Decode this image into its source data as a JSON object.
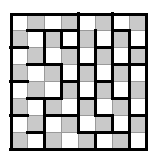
{
  "figure": {
    "kind": "puzzle-grid",
    "title": "",
    "canvas": {
      "width": 158,
      "height": 160,
      "background": "#ffffff"
    }
  },
  "grid": {
    "rows": 8,
    "columns": 8,
    "origin_x": 10,
    "origin_y": 13,
    "cell_size": 17,
    "outer_border_width": 3,
    "thin_line_width": 1,
    "thick_line_width": 3,
    "colors": {
      "light_cell": "#ffffff",
      "shaded_cell": "#c9c9c9",
      "thin_line": "#9a9a9a",
      "thick_line": "#000000",
      "outer_border": "#000000"
    },
    "shading_pattern": "checkerboard",
    "cells": [
      [
        "light",
        "shade",
        "light",
        "shade",
        "light",
        "shade",
        "light",
        "shade"
      ],
      [
        "shade",
        "light",
        "shade",
        "light",
        "shade",
        "light",
        "shade",
        "light"
      ],
      [
        "light",
        "shade",
        "light",
        "shade",
        "light",
        "shade",
        "light",
        "shade"
      ],
      [
        "shade",
        "light",
        "shade",
        "light",
        "shade",
        "light",
        "shade",
        "light"
      ],
      [
        "light",
        "shade",
        "light",
        "shade",
        "light",
        "shade",
        "light",
        "shade"
      ],
      [
        "shade",
        "light",
        "shade",
        "light",
        "shade",
        "light",
        "shade",
        "light"
      ],
      [
        "light",
        "shade",
        "light",
        "shade",
        "light",
        "shade",
        "light",
        "shade"
      ],
      [
        "shade",
        "light",
        "shade",
        "light",
        "shade",
        "light",
        "shade",
        "light"
      ]
    ],
    "thick_horizontal_segments": [
      [
        0,
        1
      ],
      [
        0,
        2
      ],
      [
        0,
        3
      ],
      [
        0,
        6
      ],
      [
        1,
        0
      ],
      [
        1,
        3
      ],
      [
        1,
        5
      ],
      [
        1,
        7
      ],
      [
        2,
        1
      ],
      [
        2,
        2
      ],
      [
        2,
        4
      ],
      [
        2,
        6
      ],
      [
        2,
        7
      ],
      [
        3,
        0
      ],
      [
        3,
        3
      ],
      [
        3,
        5
      ],
      [
        4,
        1
      ],
      [
        4,
        2
      ],
      [
        4,
        4
      ],
      [
        4,
        6
      ],
      [
        5,
        0
      ],
      [
        5,
        2
      ],
      [
        5,
        3
      ],
      [
        5,
        5
      ],
      [
        5,
        7
      ],
      [
        6,
        1
      ],
      [
        6,
        4
      ],
      [
        6,
        5
      ],
      [
        6,
        6
      ],
      [
        7,
        0
      ],
      [
        7,
        1
      ],
      [
        7,
        2
      ],
      [
        7,
        3
      ],
      [
        7,
        4
      ],
      [
        7,
        5
      ],
      [
        7,
        6
      ],
      [
        7,
        7
      ]
    ],
    "thick_vertical_segments": [
      [
        0,
        3
      ],
      [
        0,
        5
      ],
      [
        1,
        1
      ],
      [
        1,
        2
      ],
      [
        1,
        3
      ],
      [
        1,
        4
      ],
      [
        1,
        5
      ],
      [
        1,
        6
      ],
      [
        2,
        1
      ],
      [
        2,
        3
      ],
      [
        2,
        4
      ],
      [
        2,
        5
      ],
      [
        2,
        6
      ],
      [
        3,
        2
      ],
      [
        3,
        3
      ],
      [
        3,
        4
      ],
      [
        3,
        5
      ],
      [
        3,
        6
      ],
      [
        4,
        2
      ],
      [
        4,
        3
      ],
      [
        4,
        4
      ],
      [
        4,
        5
      ],
      [
        4,
        6
      ],
      [
        5,
        1
      ],
      [
        5,
        3
      ],
      [
        5,
        4
      ],
      [
        5,
        6
      ],
      [
        6,
        1
      ],
      [
        6,
        3
      ],
      [
        6,
        5
      ],
      [
        6,
        6
      ],
      [
        7,
        1
      ],
      [
        7,
        4
      ],
      [
        7,
        6
      ]
    ]
  },
  "legend": {
    "light_label": "unshaded cell",
    "shaded_label": "shaded cell",
    "thick_label": "region boundary"
  }
}
